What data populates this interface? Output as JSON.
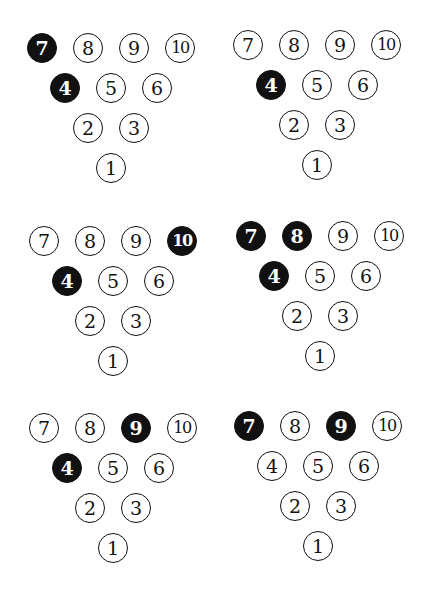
{
  "colors": {
    "standing_pin_fill": "#ffffff",
    "knocked_pin_fill": "#111111",
    "outline": "#111111"
  },
  "pin_labels": [
    "1",
    "2",
    "3",
    "4",
    "5",
    "6",
    "7",
    "8",
    "9",
    "10"
  ],
  "diagrams": [
    {
      "name": "diagram-1",
      "highlighted_pins": [
        7,
        4
      ]
    },
    {
      "name": "diagram-2",
      "highlighted_pins": [
        4
      ]
    },
    {
      "name": "diagram-3",
      "highlighted_pins": [
        10,
        4
      ]
    },
    {
      "name": "diagram-4",
      "highlighted_pins": [
        7,
        8,
        4
      ]
    },
    {
      "name": "diagram-5",
      "highlighted_pins": [
        9,
        4
      ]
    },
    {
      "name": "diagram-6",
      "highlighted_pins": [
        7,
        9
      ]
    }
  ]
}
